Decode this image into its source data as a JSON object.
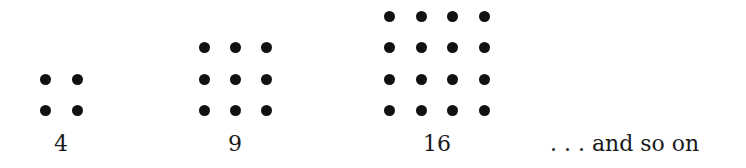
{
  "figure": {
    "groups": [
      {
        "label": "4",
        "size": 2,
        "xs": [
          45,
          77
        ],
        "ys": [
          79,
          110
        ],
        "label_x": 61
      },
      {
        "label": "9",
        "size": 3,
        "xs": [
          204,
          235,
          266
        ],
        "ys": [
          47,
          79,
          110
        ],
        "label_x": 235
      },
      {
        "label": "16",
        "size": 4,
        "xs": [
          389,
          421,
          452,
          484
        ],
        "ys": [
          16,
          47,
          79,
          110
        ],
        "label_x": 437
      }
    ],
    "tail_text": ". . . and so on",
    "dot_color": "#111111"
  }
}
